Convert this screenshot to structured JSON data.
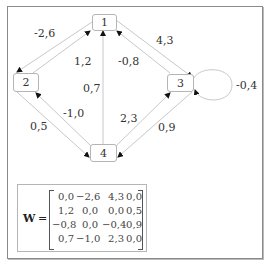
{
  "graph": {
    "nodes": [
      {
        "id": "1",
        "label": "1"
      },
      {
        "id": "2",
        "label": "2"
      },
      {
        "id": "3",
        "label": "3"
      },
      {
        "id": "4",
        "label": "4"
      }
    ],
    "edges": [
      {
        "from": "1",
        "to": "2",
        "weight": "-2,6"
      },
      {
        "from": "2",
        "to": "1",
        "weight": "1,2"
      },
      {
        "from": "1",
        "to": "3",
        "weight": "4,3"
      },
      {
        "from": "3",
        "to": "1",
        "weight": "-0,8"
      },
      {
        "from": "4",
        "to": "1",
        "weight": "0,7"
      },
      {
        "from": "4",
        "to": "2",
        "weight": "-1,0"
      },
      {
        "from": "2",
        "to": "4",
        "weight": "0,5"
      },
      {
        "from": "4",
        "to": "3",
        "weight": "2,3"
      },
      {
        "from": "3",
        "to": "4",
        "weight": "0,9"
      },
      {
        "from": "3",
        "to": "3",
        "weight": "-0,4"
      }
    ]
  },
  "matrix": {
    "symbol": "W",
    "equals": "=",
    "rows": [
      [
        "0,0",
        "−2,6",
        "4,3",
        "0,0"
      ],
      [
        "1,2",
        "0,0",
        "0,0",
        "0,5"
      ],
      [
        "−0,8",
        "0,0",
        "−0,4",
        "0,9"
      ],
      [
        "0,7",
        "−1,0",
        "2,3",
        "0,0"
      ]
    ]
  }
}
